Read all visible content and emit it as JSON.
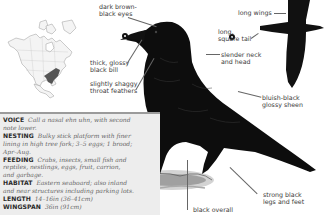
{
  "species_page": {
    "range_map": {
      "name": "North America range map",
      "highlight_color": "#555555"
    },
    "annotations": {
      "eyes": [
        "dark brown-",
        "black eyes"
      ],
      "bill": [
        "thick, glossy",
        "black bill"
      ],
      "throat": [
        "slightly shaggy",
        "throat feathers"
      ],
      "wings": "long wings",
      "tail": [
        "long,",
        "square tail"
      ],
      "neck": [
        "slender neck",
        "and head"
      ],
      "sheen": [
        "bluish-black",
        "glossy sheen"
      ],
      "legs": [
        "strong black",
        "legs and feet"
      ],
      "overall": "black overall"
    },
    "info": {
      "voice": {
        "key": "VOICE",
        "lines": [
          "Call a nasal ehn uhn, with second",
          "note lower."
        ]
      },
      "nesting": {
        "key": "NESTING",
        "lines": [
          "Bulky stick platform with finer",
          "lining in high tree fork; 3–5 eggs; 1 brood;",
          "Apr–Aug."
        ]
      },
      "feeding": {
        "key": "FEEDING",
        "lines": [
          "Crabs, insects, small fish and",
          "reptiles, nestlings, eggs, fruit, carrion,",
          "and garbage."
        ]
      },
      "habitat": {
        "key": "HABITAT",
        "lines": [
          "Eastern seaboard; also inland",
          "and near structures including parking lots."
        ]
      },
      "length": {
        "key": "LENGTH",
        "value": "14–16in (36–41cm)"
      },
      "wingspan": {
        "key": "WINGSPAN",
        "value": "36in (91cm)"
      }
    },
    "colors": {
      "box_bg": "#ededed",
      "box_border": "#9b9b9b",
      "bird": "#0d0d0d"
    }
  }
}
